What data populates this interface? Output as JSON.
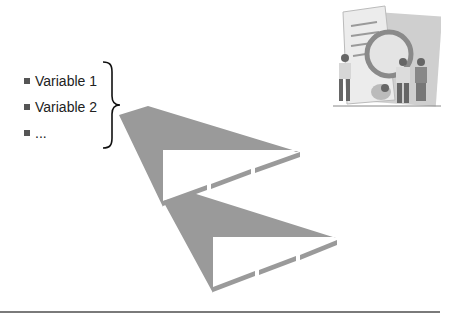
{
  "slide": {
    "bullets": [
      {
        "label": "Variable 1"
      },
      {
        "label": "Variable 2"
      },
      {
        "label": "..."
      }
    ],
    "brace_icon": "right-curly-brace",
    "arrows": [
      {
        "name": "funnel-arrow-1",
        "color": "#9a9a9a"
      },
      {
        "name": "funnel-arrow-2",
        "color": "#9a9a9a"
      }
    ],
    "clipart_icon": "people-with-magnifying-glass-clipart",
    "colors": {
      "shape_fill": "#9a9a9a",
      "text": "#222222",
      "rule": "#7a7a7a",
      "background": "#ffffff"
    }
  }
}
